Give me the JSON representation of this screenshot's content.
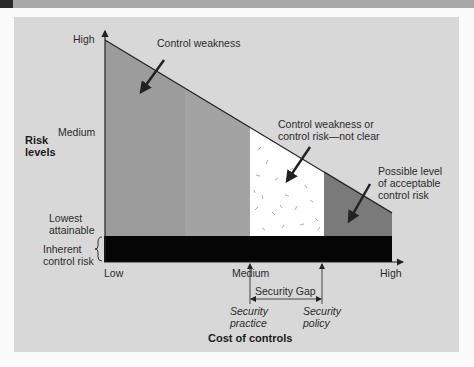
{
  "figure": {
    "y_axis": {
      "title_line1": "Risk",
      "title_line2": "levels",
      "ticks": {
        "high": "High",
        "medium": "Medium",
        "lowest_line1": "Lowest",
        "lowest_line2": "attainable"
      },
      "inherent_line1": "Inherent",
      "inherent_line2": "control risk"
    },
    "x_axis": {
      "title": "Cost of controls",
      "ticks": {
        "low": "Low",
        "medium": "Medium",
        "high": "High"
      }
    },
    "annotations": {
      "control_weakness": "Control weakness",
      "unclear_line1": "Control weakness or",
      "unclear_line2": "control risk—not clear",
      "acceptable_line1": "Possible level",
      "acceptable_line2": "of acceptable",
      "acceptable_line3": "control risk",
      "security_gap": "Security Gap",
      "practice_line1": "Security",
      "practice_line2": "practice",
      "policy_line1": "Security",
      "policy_line2": "policy"
    },
    "colors": {
      "panel_bg": "#d8d8d8",
      "weakness_region": "#9c9c9c",
      "weakness_region_right": "#a2a2a2",
      "unclear_region": "#ffffff",
      "acceptable_region": "#7a7a7a",
      "inherent_bar": "#050505"
    }
  }
}
